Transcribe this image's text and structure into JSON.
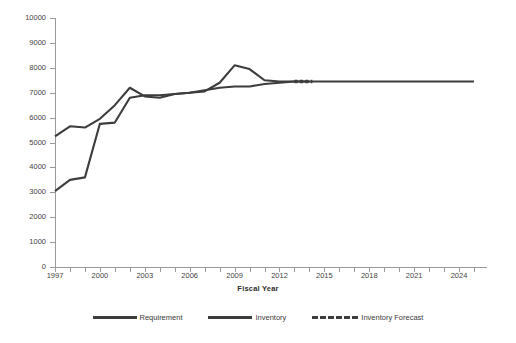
{
  "chart_data": {
    "type": "line",
    "title": "",
    "xlabel": "Fiscal Year",
    "ylabel": "",
    "xlim": [
      1997,
      2025.4
    ],
    "ylim": [
      0,
      10000
    ],
    "grid": false,
    "legend_position": "bottom",
    "y_ticks": [
      0,
      1000,
      2000,
      3000,
      4000,
      5000,
      6000,
      7000,
      8000,
      9000,
      10000
    ],
    "y_tick_labels": [
      "0",
      "1000",
      "2000",
      "3000",
      "4000",
      "5000",
      "6000",
      "7000",
      "8000",
      "9000",
      "10000"
    ],
    "x_ticks": [
      1997,
      1998,
      1999,
      2000,
      2001,
      2002,
      2003,
      2004,
      2005,
      2006,
      2007,
      2008,
      2009,
      2010,
      2011,
      2012,
      2013,
      2014,
      2015,
      2016,
      2017,
      2018,
      2019,
      2020,
      2021,
      2022,
      2023,
      2024,
      2025
    ],
    "x_tick_labels": [
      "1997",
      "2000",
      "2003",
      "2006",
      "2009",
      "2012",
      "2015",
      "2018",
      "2021",
      "2024"
    ],
    "x_tick_label_years": [
      1997,
      2000,
      2003,
      2006,
      2009,
      2012,
      2015,
      2018,
      2021,
      2024
    ],
    "line_color": "#3d3d3d",
    "series": [
      {
        "name": "Requirement",
        "style": "solid",
        "x": [
          1997,
          1998,
          1999,
          2000,
          2001,
          2002,
          2003,
          2004,
          2005,
          2006,
          2007,
          2008,
          2009,
          2010,
          2011,
          2012,
          2013,
          2014,
          2015,
          2016,
          2017,
          2018,
          2019,
          2020,
          2021,
          2022,
          2023,
          2024,
          2025
        ],
        "values": [
          5250,
          5650,
          5600,
          5950,
          6500,
          7200,
          6850,
          6800,
          6950,
          7000,
          7050,
          7400,
          8100,
          7950,
          7500,
          7450,
          7450,
          7450,
          7450,
          7450,
          7450,
          7450,
          7450,
          7450,
          7450,
          7450,
          7450,
          7450,
          7450
        ]
      },
      {
        "name": "Inventory",
        "style": "solid",
        "x": [
          1997,
          1998,
          1999,
          2000,
          2001,
          2002,
          2003,
          2004,
          2005,
          2006,
          2007,
          2008,
          2009,
          2010,
          2011,
          2012,
          2013,
          2014
        ],
        "values": [
          3050,
          3500,
          3600,
          5750,
          5800,
          6800,
          6900,
          6900,
          6950,
          7000,
          7100,
          7200,
          7250,
          7250,
          7350,
          7400,
          7450,
          7450
        ]
      },
      {
        "name": "Inventory Forecast",
        "style": "dashed",
        "x": [
          2013,
          2013.4,
          2013.8,
          2014.2
        ],
        "values": [
          7450,
          7450,
          7450,
          7450
        ]
      }
    ],
    "legend": [
      "Requirement",
      "Inventory",
      "Inventory Forecast"
    ]
  }
}
